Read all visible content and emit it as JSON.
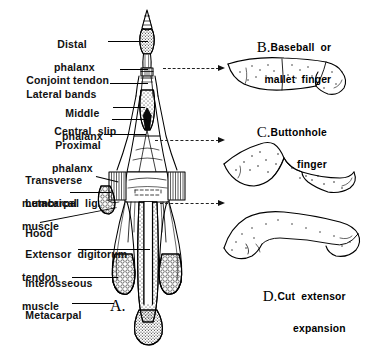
{
  "figure": {
    "title_letters": [
      "A.",
      "B.",
      "C.",
      "D."
    ]
  },
  "left_labels": [
    {
      "id": "distal-phalanx",
      "line1": "Distal",
      "line2": "phalanx"
    },
    {
      "id": "conjoint-tendon",
      "line1": "Conjoint tendon",
      "line2": ""
    },
    {
      "id": "lateral-bands",
      "line1": "Lateral bands",
      "line2": ""
    },
    {
      "id": "middle-phalanx",
      "line1": "Middle",
      "line2": "phalanx"
    },
    {
      "id": "central-slip",
      "line1": "Central  slip",
      "line2": ""
    },
    {
      "id": "proximal-phalanx",
      "line1": "Proximal",
      "line2": "phalanx"
    },
    {
      "id": "transverse-metacarpal-ligament",
      "line1": "Transverse",
      "line2": "metacarpal  lig."
    },
    {
      "id": "lumbrical-muscle",
      "line1": "Lumbrical",
      "line2": "muscle"
    },
    {
      "id": "hood",
      "line1": "Hood",
      "line2": ""
    },
    {
      "id": "extensor-digitorum-tendon",
      "line1": "Extensor  digitorum",
      "line2": "tendon"
    },
    {
      "id": "interosseous-muscle",
      "line1": "Interosseous",
      "line2": "muscle"
    },
    {
      "id": "metacarpal",
      "line1": "Metacarpal",
      "line2": ""
    }
  ],
  "panels": {
    "a": {
      "letter": "A.",
      "caption": ""
    },
    "b": {
      "letter": "B.",
      "line1": "Baseball  or",
      "line2": "mallet  finger"
    },
    "c": {
      "letter": "C.",
      "line1": "Buttonhole",
      "line2": "finger"
    },
    "d": {
      "letter": "D.",
      "line1": "Cut  extensor",
      "line2": "expansion"
    }
  },
  "colors": {
    "ink": "#000000",
    "background": "#ffffff",
    "stipple": "#222222"
  }
}
